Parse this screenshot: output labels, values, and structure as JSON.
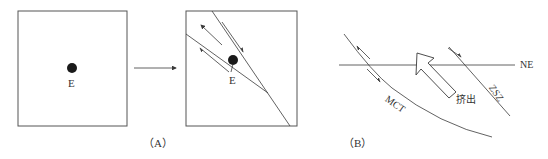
{
  "panel_a": {
    "caption": "（A）",
    "before_box": {
      "point_label": "E"
    },
    "after_box": {
      "point_label": "E"
    },
    "transition_arrow": "arrow-right"
  },
  "panel_b": {
    "caption": "（B）",
    "axis_label": "NE",
    "fault_left_label": "MCT",
    "fault_right_label": "ZSZ",
    "extrusion_label": "挤出"
  },
  "colors": {
    "line": "#3a3a3a",
    "dot": "#1a1a1a",
    "text": "#333333"
  }
}
